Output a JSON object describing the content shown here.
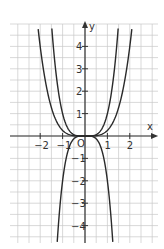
{
  "chart_data": {
    "type": "line",
    "title": "",
    "xlabel": "x",
    "ylabel": "y",
    "origin_label": "O",
    "xlim": [
      -3.4,
      3.25
    ],
    "ylim": [
      -4.8,
      5.0
    ],
    "grid": true,
    "grid_step": 0.5,
    "x_ticks": [
      -2,
      -1,
      1,
      2
    ],
    "x_tick_labels": [
      "−2",
      "−1",
      "1",
      "2"
    ],
    "y_ticks": [
      4,
      3,
      2,
      1,
      -1,
      -2,
      -3,
      -4
    ],
    "y_tick_labels": [
      "4",
      "3",
      "2",
      "1",
      "−1",
      "−2",
      "−3",
      "−4"
    ],
    "series": [
      {
        "name": "y = x^4",
        "coef": 1,
        "power": 4,
        "x_range": [
          -1.48,
          1.48
        ]
      },
      {
        "name": "y = 0.25x^4",
        "coef": 0.25,
        "power": 4,
        "x_range": [
          -2.09,
          2.09
        ]
      },
      {
        "name": "y = -2x^4",
        "coef": -2,
        "power": 4,
        "x_range": [
          -1.24,
          1.24
        ]
      }
    ],
    "legend": "none"
  },
  "colors": {
    "grid": "#c8c8c8",
    "axis": "#333333",
    "curve": "#2a2a2a"
  }
}
